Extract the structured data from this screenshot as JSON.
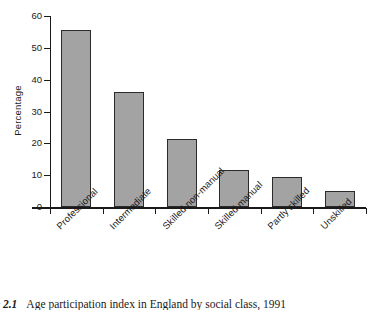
{
  "caption": {
    "number": "e 2.1",
    "text": "Age participation index in England by social class, 1991"
  },
  "colors": {
    "bar_fill": "#a3a3a3",
    "bar_stroke": "#2b2b2b",
    "axis": "#1a1a1a",
    "background": "#ffffff"
  },
  "chart_data": {
    "type": "bar",
    "title": "",
    "xlabel": "",
    "ylabel": "Percentage",
    "ylim": [
      0,
      60
    ],
    "yticks": [
      0,
      10,
      20,
      30,
      40,
      50,
      60
    ],
    "ytick_labels": [
      "0",
      "10",
      "20",
      "30",
      "40",
      "50",
      "60"
    ],
    "grid": false,
    "legend": false,
    "categories": [
      "Professional",
      "Intermediate",
      "Skilled non-manual",
      "Skilled manual",
      "Partly skilled",
      "Unskilled"
    ],
    "values": [
      55.5,
      36.0,
      21.3,
      11.5,
      9.3,
      5.1
    ]
  }
}
